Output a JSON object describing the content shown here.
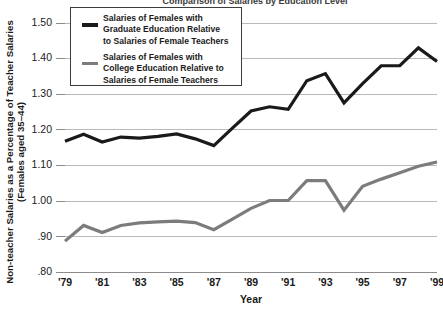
{
  "chart_data": {
    "type": "line",
    "title": "Comparison of Salaries by Education Level",
    "xlabel": "Year",
    "ylabel": "Non-teacher Salaries as a Percentage of Teacher Salaries\n(Females aged 35–44)",
    "ylabel_line1": "Non-teacher Salaries as a Percentage of Teacher Salaries",
    "ylabel_line2": "(Females aged 35–44)",
    "x": [
      1979,
      1980,
      1981,
      1982,
      1983,
      1984,
      1985,
      1986,
      1987,
      1988,
      1989,
      1990,
      1991,
      1992,
      1993,
      1994,
      1995,
      1996,
      1997,
      1998,
      1999
    ],
    "xtick_labels": [
      "'79",
      "'81",
      "'83",
      "'85",
      "'87",
      "'89",
      "'91",
      "'93",
      "'95",
      "'97",
      "'99"
    ],
    "xtick_values": [
      1979,
      1981,
      1983,
      1985,
      1987,
      1989,
      1991,
      1993,
      1995,
      1997,
      1999
    ],
    "ytick_labels": [
      "1.50",
      "1.40",
      "1.30",
      "1.20",
      "1.10",
      "1.00",
      ".90",
      ".80"
    ],
    "ytick_values": [
      1.5,
      1.4,
      1.3,
      1.2,
      1.1,
      1.0,
      0.9,
      0.8
    ],
    "xlim": [
      1979,
      1999
    ],
    "ylim": [
      0.8,
      1.54
    ],
    "grid": true,
    "legend_position": "top-left",
    "series": [
      {
        "name": "graduate",
        "label": "Salaries of Females with\nGraduate Education Relative\nto Salaries of Female Teachers",
        "color": "#1a1a1a",
        "width": 3.2,
        "values": [
          1.168,
          1.188,
          1.166,
          1.18,
          1.177,
          1.182,
          1.189,
          1.175,
          1.156,
          1.205,
          1.253,
          1.265,
          1.258,
          1.338,
          1.358,
          1.276,
          1.33,
          1.38,
          1.38,
          1.43,
          1.392
        ]
      },
      {
        "name": "college",
        "label": "Salaries of Females with\nCollege Education Relative to\nSalaries of Female Teachers",
        "color": "#7c7c7c",
        "width": 3.2,
        "values": [
          0.888,
          0.932,
          0.912,
          0.932,
          0.939,
          0.942,
          0.944,
          0.94,
          0.92,
          0.95,
          0.98,
          1.002,
          1.002,
          1.058,
          1.058,
          0.975,
          1.042,
          1.062,
          1.08,
          1.098,
          1.11
        ]
      }
    ]
  },
  "legend": {
    "entries": [
      {
        "swatch_name": "legend-swatch-graduate",
        "text": "Salaries of Females with\nGraduate Education Relative\nto Salaries of Female Teachers"
      },
      {
        "swatch_name": "legend-swatch-college",
        "text": "Salaries of Females with\nCollege Education Relative to\nSalaries of Female Teachers"
      }
    ]
  },
  "colors": {
    "graduate": "#1a1a1a",
    "college": "#7c7c7c",
    "grid": "#b9b9b9",
    "axis": "#8c8c8c",
    "text": "#1a1a1a",
    "background": "#ffffff"
  }
}
